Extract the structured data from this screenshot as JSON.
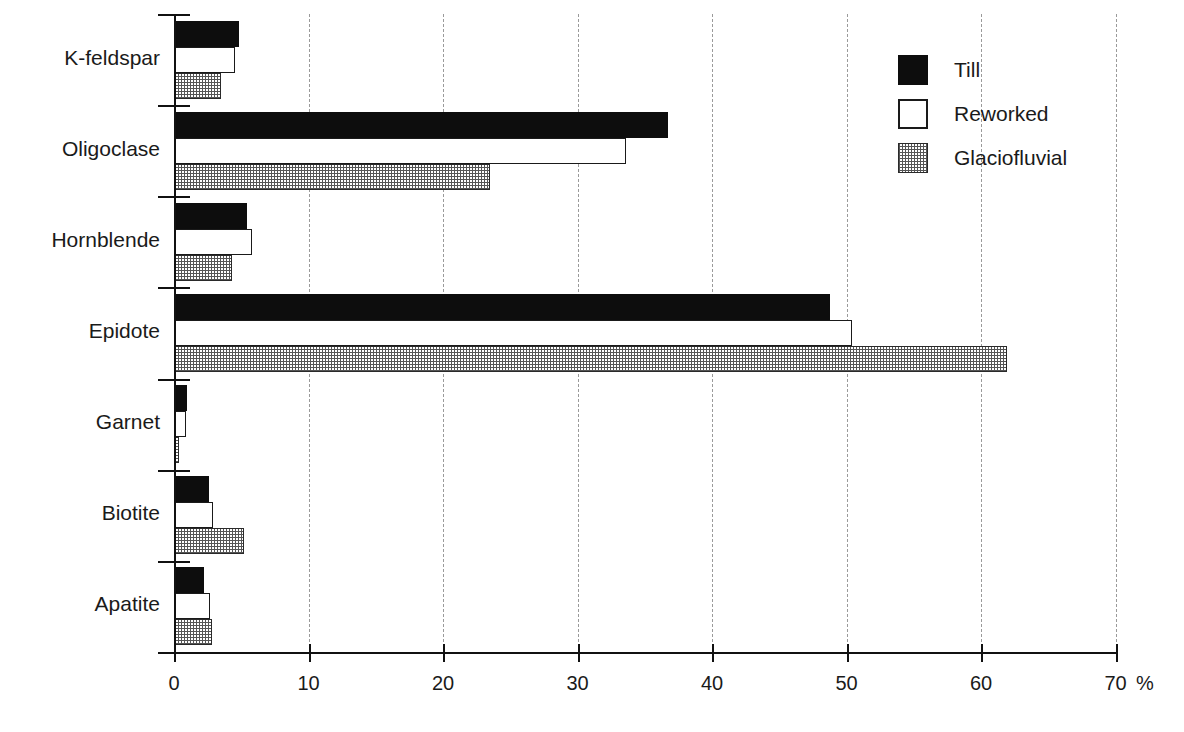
{
  "chart_data": {
    "type": "bar",
    "orientation": "horizontal",
    "title": "",
    "subtitle": "",
    "xlabel": "%",
    "ylabel": "",
    "xlim": [
      0,
      70
    ],
    "xticks": [
      0,
      10,
      20,
      30,
      40,
      50,
      60,
      70
    ],
    "xticklabels": [
      "0",
      "10",
      "20",
      "30",
      "40",
      "50",
      "60",
      "70"
    ],
    "grid": "vertical-dashed",
    "legend_position": "top-right",
    "categories": [
      "K-feldspar",
      "Oligoclase",
      "Hornblende",
      "Epidote",
      "Garnet",
      "Biotite",
      "Apatite"
    ],
    "series": [
      {
        "name": "Till",
        "fill": "solid-black",
        "color": "#0d0d0d",
        "values": [
          4.8,
          36.7,
          5.4,
          48.8,
          1.0,
          2.6,
          2.2
        ]
      },
      {
        "name": "Reworked",
        "fill": "white-outline",
        "color": "#ffffff",
        "values": [
          4.5,
          33.6,
          5.8,
          50.4,
          0.9,
          2.9,
          2.7
        ]
      },
      {
        "name": "Glaciofluvial",
        "fill": "checkered-gray",
        "color": "#6e6e6e",
        "values": [
          3.5,
          23.5,
          4.3,
          61.9,
          0.4,
          5.2,
          2.8
        ]
      }
    ]
  },
  "axis": {
    "x_unit": "%",
    "tick_labels": [
      "0",
      "10",
      "20",
      "30",
      "40",
      "50",
      "60",
      "70"
    ]
  },
  "legend": {
    "items": [
      {
        "label": "Till",
        "swatch": "solid-black-swatch"
      },
      {
        "label": "Reworked",
        "swatch": "white-outline-swatch"
      },
      {
        "label": "Glaciofluvial",
        "swatch": "checkered-gray-swatch"
      }
    ]
  }
}
